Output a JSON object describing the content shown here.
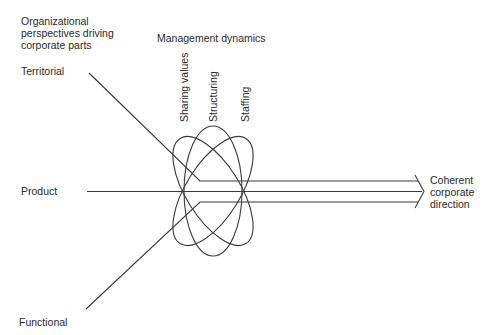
{
  "header": {
    "perspectives_title": [
      "Organizational",
      "perspectives driving",
      "corporate parts"
    ],
    "dynamics_title": "Management dynamics"
  },
  "perspectives": [
    {
      "label": "Territorial"
    },
    {
      "label": "Product"
    },
    {
      "label": "Functional"
    }
  ],
  "dynamics": [
    {
      "label": "Sharing values"
    },
    {
      "label": "Structuring"
    },
    {
      "label": "Staffing"
    }
  ],
  "outcome": {
    "lines": [
      "Coherent",
      "corporate",
      "direction"
    ]
  },
  "colors": {
    "stroke": "#3a3a3a",
    "text": "#2a2a2a",
    "background": "#ffffff"
  }
}
